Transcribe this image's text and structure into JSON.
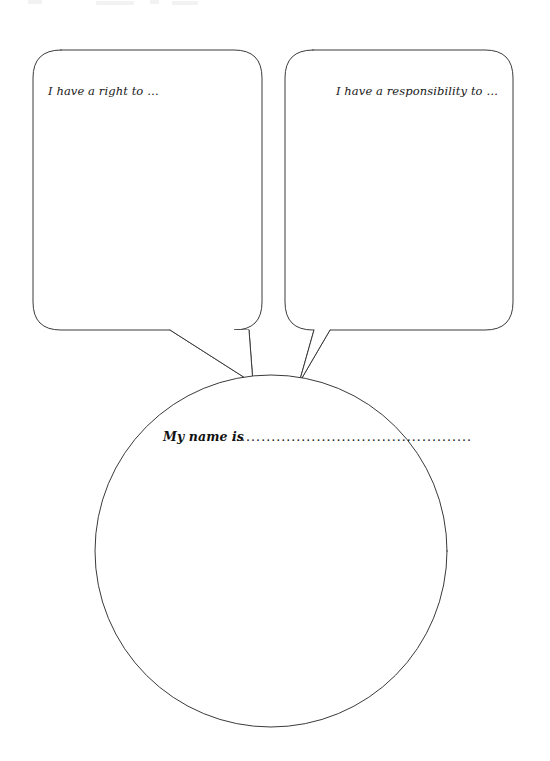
{
  "page": {
    "background_color": "#ffffff",
    "ink_color": "#3a3a3a",
    "text_color": "#171717",
    "width": 550,
    "height": 761
  },
  "bubbles": [
    {
      "id": "right-bubble",
      "name": "speech-bubble-right-statement",
      "prompt": "I have a right to …",
      "text_align": "left",
      "box": {
        "x": 33,
        "y": 50,
        "width": 229,
        "height": 280,
        "corner_radius": 28
      },
      "text_position": {
        "x": 48,
        "y": 95
      },
      "tail": {
        "base_left_x": 170,
        "base_right_x": 249,
        "base_y": 330,
        "tip_x": 253,
        "tip_y": 383
      }
    },
    {
      "id": "responsibility-bubble",
      "name": "speech-bubble-responsibility-statement",
      "prompt": "I have a responsibility to …",
      "text_align": "right",
      "box": {
        "x": 285,
        "y": 50,
        "width": 228,
        "height": 280,
        "corner_radius": 28
      },
      "text_position": {
        "x": 498,
        "y": 95
      },
      "tail": {
        "base_left_x": 314,
        "base_right_x": 330,
        "base_y": 330,
        "tip_x": 299,
        "tip_y": 383
      }
    }
  ],
  "circle": {
    "name": "name-circle",
    "center_x": 271,
    "center_y": 551,
    "radius": 176,
    "name_label": "My name is",
    "dot_leader": "................................................",
    "label_position": {
      "x": 163,
      "y": 441
    },
    "leader_position": {
      "x": 232,
      "y": 441
    }
  }
}
